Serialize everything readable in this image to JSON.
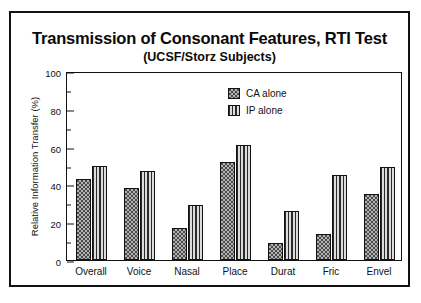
{
  "chart_data": {
    "type": "bar",
    "title": "Transmission of Consonant Features, RTI Test",
    "subtitle": "(UCSF/Storz Subjects)",
    "xlabel": "",
    "ylabel": "Relative Information Transfer (%)",
    "ylim": [
      0,
      100
    ],
    "ytick_major": [
      0,
      20,
      40,
      60,
      80,
      100
    ],
    "ytick_minor": [
      10,
      30,
      50,
      70,
      90
    ],
    "grid": false,
    "legend_position": "top-right-inside",
    "categories": [
      "Overall",
      "Voice",
      "Nasal",
      "Place",
      "Durat",
      "Fric",
      "Envel"
    ],
    "series": [
      {
        "name": "CA alone",
        "fill": "stipple",
        "values": [
          43,
          38,
          17,
          52,
          9,
          14,
          35
        ]
      },
      {
        "name": "IP alone",
        "fill": "vertical-stripes",
        "values": [
          50,
          47,
          29,
          61,
          26,
          45,
          49
        ]
      }
    ]
  },
  "legend": {
    "items": [
      {
        "label": "CA alone"
      },
      {
        "label": "IP alone"
      }
    ]
  },
  "colors": {
    "ink": "#111111",
    "ca_fill": "#b4b4b4",
    "ip_fill": "#c9c9c9",
    "frame": "#121212"
  }
}
